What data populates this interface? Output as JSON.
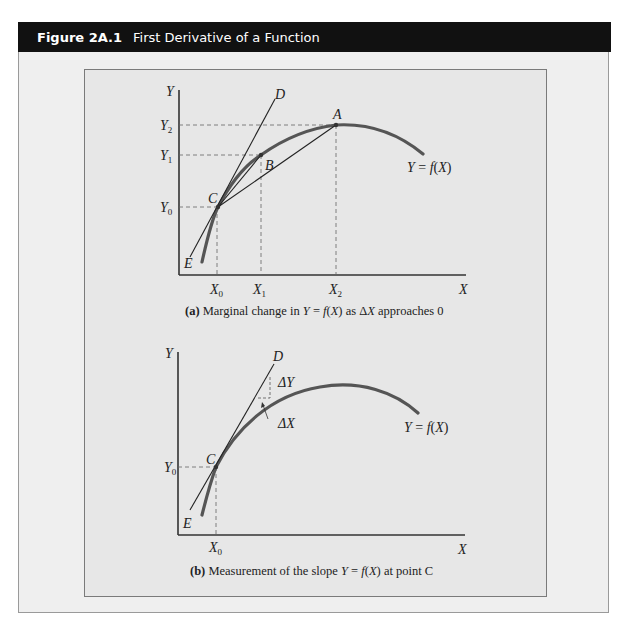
{
  "figure": {
    "number": "Figure 2A.1",
    "title": "First Derivative of a Function"
  },
  "panel_a": {
    "caption_prefix": "(a)",
    "caption_text_1": " Marginal change in ",
    "caption_Y": "Y",
    "caption_eq": " = ",
    "caption_f": "f",
    "caption_paren_open": "(",
    "caption_X": "X",
    "caption_paren_close": ")",
    "caption_text_2": " as Δ",
    "caption_X2": "X",
    "caption_text_3": " approaches 0",
    "y_axis_label": "Y",
    "x_axis_label": "X",
    "y_ticks": [
      {
        "base": "Y",
        "sub": "2"
      },
      {
        "base": "Y",
        "sub": "1"
      },
      {
        "base": "Y",
        "sub": "0"
      }
    ],
    "x_ticks": [
      {
        "base": "X",
        "sub": "0"
      },
      {
        "base": "X",
        "sub": "1"
      },
      {
        "base": "X",
        "sub": "2"
      }
    ],
    "points": {
      "A": "A",
      "B": "B",
      "C": "C",
      "D": "D",
      "E": "E"
    },
    "function_label": {
      "Y": "Y",
      "eq": " = ",
      "f": "f",
      "open": "(",
      "X": "X",
      "close": ")"
    }
  },
  "panel_b": {
    "caption_prefix": "(b)",
    "caption_text_1": " Measurement of the slope ",
    "caption_Y": "Y",
    "caption_eq": " = ",
    "caption_f": "f",
    "caption_paren_open": "(",
    "caption_X": "X",
    "caption_paren_close": ")",
    "caption_text_2": " at point C",
    "y_axis_label": "Y",
    "x_axis_label": "X",
    "y_ticks": [
      {
        "base": "Y",
        "sub": "0"
      }
    ],
    "x_ticks": [
      {
        "base": "X",
        "sub": "0"
      }
    ],
    "points": {
      "C": "C",
      "D": "D",
      "E": "E"
    },
    "delta_y": "ΔY",
    "delta_x": "ΔX",
    "function_label": {
      "Y": "Y",
      "eq": " = ",
      "f": "f",
      "open": "(",
      "X": "X",
      "close": ")"
    }
  },
  "colors": {
    "header_bg": "#111111",
    "outer_bg": "#efefef",
    "inner_bg": "#e7e7e7",
    "curve": "#555555",
    "line": "#222222"
  }
}
